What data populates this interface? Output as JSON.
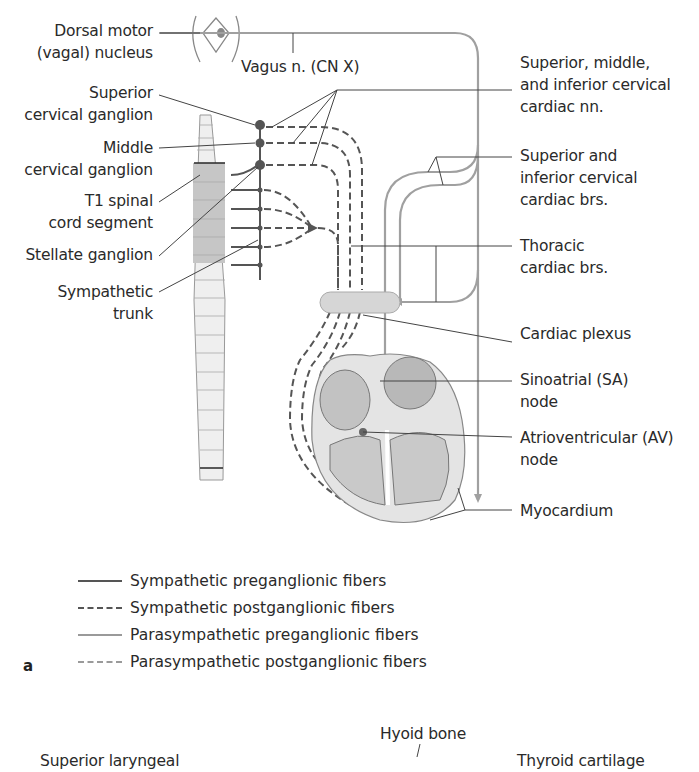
{
  "figure": {
    "panel_letter": "a",
    "labels_left": {
      "dorsal_motor": [
        "Dorsal motor",
        "(vagal) nucleus"
      ],
      "superior_cervical": [
        "Superior",
        "cervical ganglion"
      ],
      "middle_cervical": [
        "Middle",
        "cervical ganglion"
      ],
      "t1_segment": [
        "T1 spinal",
        "cord segment"
      ],
      "stellate": [
        "Stellate ganglion"
      ],
      "sympathetic_trunk": [
        "Sympathetic",
        "trunk"
      ]
    },
    "labels_center": {
      "vagus": "Vagus n. (CN X)"
    },
    "labels_right": {
      "cervical_cardiac_nn": [
        "Superior, middle,",
        "and inferior cervical",
        "cardiac nn."
      ],
      "cervical_cardiac_brs": [
        "Superior and",
        "inferior cervical",
        "cardiac brs."
      ],
      "thoracic_cardiac_brs": [
        "Thoracic",
        "cardiac brs."
      ],
      "cardiac_plexus": [
        "Cardiac plexus"
      ],
      "sa_node": [
        "Sinoatrial (SA)",
        "node"
      ],
      "av_node": [
        "Atrioventricular (AV)",
        "node"
      ],
      "myocardium": [
        "Myocardium"
      ]
    },
    "legend": [
      {
        "label": "Sympathetic preganglionic fibers",
        "style": "solid",
        "color": "#555555"
      },
      {
        "label": "Sympathetic postganglionic fibers",
        "style": "dashed",
        "color": "#555555"
      },
      {
        "label": "Parasympathetic preganglionic fibers",
        "style": "solid",
        "color": "#9a9a9a"
      },
      {
        "label": "Parasympathetic postganglionic fibers",
        "style": "dashed",
        "color": "#9a9a9a"
      }
    ],
    "next_panel": {
      "hyoid": "Hyoid bone",
      "left_cut": "Superior laryngeal",
      "right_cut": "Thyroid cartilage"
    },
    "colors": {
      "sympathetic": "#555555",
      "parasympathetic": "#9a9a9a",
      "cord_shaded": "#c8c8c8",
      "cord_light": "#efefef",
      "plexus": "#d6d6d6"
    }
  }
}
